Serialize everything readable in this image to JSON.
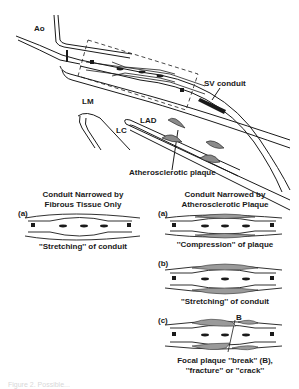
{
  "top_diagram": {
    "labels": {
      "aorta": "Ao",
      "sv_conduit": "SV conduit",
      "left_main": "LM",
      "left_circumflex": "LC",
      "lad": "LAD",
      "plaque": "Atherosclerotic plaque"
    }
  },
  "left_panel": {
    "title_line1": "Conduit Narrowed by",
    "title_line2": "Fibrous Tissue Only",
    "panels": [
      {
        "letter": "(a)",
        "caption": "''Stretching'' of conduit"
      }
    ]
  },
  "right_panel": {
    "title_line1": "Conduit Narrowed by",
    "title_line2": "Atherosclerotic Plaque",
    "panels": [
      {
        "letter": "(a)",
        "caption": "''Compression'' of plaque"
      },
      {
        "letter": "(b)",
        "caption": "''Stretching'' of conduit"
      },
      {
        "letter": "(c)",
        "caption_line1": "Focal plaque ''break'' (B),",
        "caption_line2": "''fracture'' or ''crack''",
        "marker": "B"
      }
    ]
  },
  "footer": {
    "figure_caption_partial": "Figure 2. Possible..."
  },
  "colors": {
    "ink": "#1a1a1a",
    "background": "#ffffff",
    "plaque_fill": "#8a8a8a"
  }
}
